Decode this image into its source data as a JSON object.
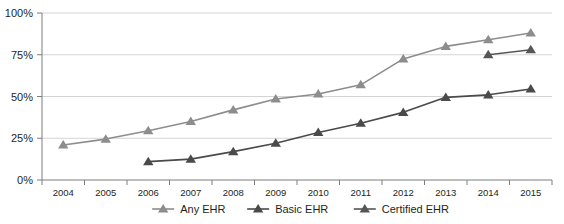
{
  "chart_data": {
    "type": "line",
    "title": "",
    "subtitle": "",
    "xlabel": "",
    "ylabel": "",
    "grid": true,
    "legend_position": "bottom",
    "ylim": [
      0,
      100
    ],
    "ytick_labels": [
      "0%",
      "25%",
      "50%",
      "75%",
      "100%"
    ],
    "ytick_values": [
      0,
      25,
      50,
      75,
      100
    ],
    "categories": [
      "2004",
      "2005",
      "2006",
      "2007",
      "2008",
      "2009",
      "2010",
      "2011",
      "2012",
      "2013",
      "2014",
      "2015"
    ],
    "series": [
      {
        "name": "Any EHR",
        "color": "#8d8d8d",
        "marker": "triangle",
        "values": [
          21,
          24.5,
          29.5,
          35,
          42,
          48.5,
          51.5,
          57,
          72.5,
          80,
          84,
          88
        ]
      },
      {
        "name": "Basic EHR",
        "color": "#4a4a4a",
        "marker": "triangle",
        "values": [
          null,
          null,
          11,
          12.5,
          17,
          22,
          28.5,
          34,
          40.5,
          49.5,
          51,
          54.5
        ]
      },
      {
        "name": "Certified EHR",
        "color": "#565656",
        "marker": "triangle",
        "values": [
          null,
          null,
          null,
          null,
          null,
          null,
          null,
          null,
          null,
          null,
          75,
          78
        ]
      }
    ]
  },
  "legend": {
    "items": [
      {
        "label": "Any EHR",
        "color": "#8d8d8d"
      },
      {
        "label": "Basic EHR",
        "color": "#4a4a4a"
      },
      {
        "label": "Certified EHR",
        "color": "#565656"
      }
    ]
  },
  "colors": {
    "gridline": "#d4d4d4",
    "axis": "#7d7d7d",
    "text": "#231f20",
    "background": "#ffffff"
  }
}
